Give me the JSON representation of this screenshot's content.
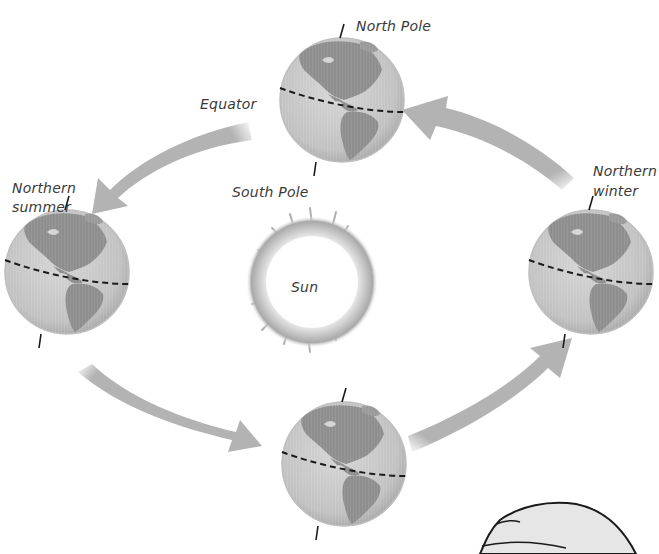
{
  "diagram": {
    "colors": {
      "arrow": "#b3b3b3",
      "globe_ocean": "#c8c8c8",
      "globe_land": "#8e8e8e",
      "equator_line": "#1a1a1a",
      "sun_glow": "#b0b0b0",
      "text": "#3a3a3a"
    },
    "labels": {
      "north_pole": "North Pole",
      "south_pole": "South Pole",
      "equator": "Equator",
      "sun": "Sun",
      "northern_summer_line1": "Northern",
      "northern_summer_line2": "summer",
      "northern_winter_line1": "Northern",
      "northern_winter_line2": "winter"
    },
    "globes": [
      {
        "position": "top",
        "cx": 342,
        "cy": 100,
        "r": 62
      },
      {
        "position": "left",
        "cx": 67,
        "cy": 272,
        "r": 62
      },
      {
        "position": "right",
        "cx": 591,
        "cy": 272,
        "r": 62
      },
      {
        "position": "bottom",
        "cx": 344,
        "cy": 464,
        "r": 62
      }
    ],
    "arrows": [
      {
        "from": "top",
        "to": "left",
        "direction": "counterclockwise"
      },
      {
        "from": "left",
        "to": "bottom",
        "direction": "counterclockwise"
      },
      {
        "from": "bottom",
        "to": "right",
        "direction": "counterclockwise"
      },
      {
        "from": "right",
        "to": "top",
        "direction": "counterclockwise"
      }
    ]
  }
}
